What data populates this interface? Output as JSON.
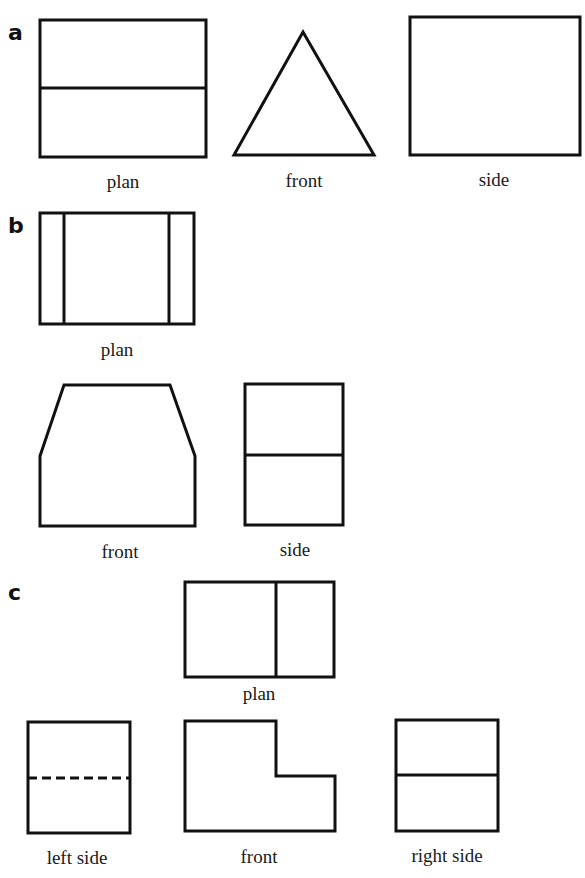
{
  "parts": [
    {
      "id": "a",
      "label": "a",
      "views": [
        {
          "name": "plan",
          "label": "plan"
        },
        {
          "name": "front",
          "label": "front"
        },
        {
          "name": "side",
          "label": "side"
        }
      ]
    },
    {
      "id": "b",
      "label": "b",
      "views": [
        {
          "name": "plan",
          "label": "plan"
        },
        {
          "name": "front",
          "label": "front"
        },
        {
          "name": "side",
          "label": "side"
        }
      ]
    },
    {
      "id": "c",
      "label": "c",
      "views": [
        {
          "name": "plan",
          "label": "plan"
        },
        {
          "name": "left-side",
          "label": "left side"
        },
        {
          "name": "front",
          "label": "front"
        },
        {
          "name": "right-side",
          "label": "right side"
        }
      ]
    }
  ],
  "style": {
    "stroke": "#111111",
    "background": "#ffffff"
  }
}
